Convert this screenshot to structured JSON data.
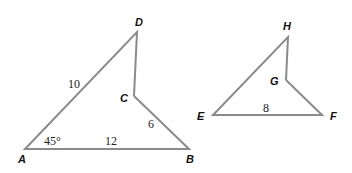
{
  "figure1": {
    "vertices": {
      "A": "A",
      "B": "B",
      "C": "C",
      "D": "D"
    },
    "measures": {
      "AD": "10",
      "AB": "12",
      "CB": "6",
      "angleA": "45°"
    }
  },
  "figure2": {
    "vertices": {
      "E": "E",
      "F": "F",
      "G": "G",
      "H": "H"
    },
    "measures": {
      "EF": "8"
    }
  },
  "colors": {
    "stroke": "#8a8a8a",
    "text": "#111111"
  }
}
